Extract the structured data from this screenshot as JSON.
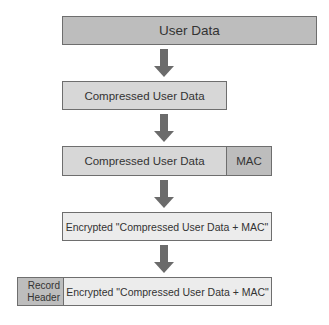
{
  "diagram": {
    "stages": [
      {
        "id": "user-data",
        "segments": [
          {
            "label": "User Data"
          }
        ]
      },
      {
        "id": "compressed",
        "segments": [
          {
            "label": "Compressed User Data"
          }
        ]
      },
      {
        "id": "compressed-mac",
        "segments": [
          {
            "label": "Compressed User Data"
          },
          {
            "label": "MAC"
          }
        ]
      },
      {
        "id": "encrypted",
        "segments": [
          {
            "label": "Encrypted \"Compressed User Data + MAC\""
          }
        ]
      },
      {
        "id": "record",
        "segments": [
          {
            "label": "Record Header"
          },
          {
            "label": "Encrypted \"Compressed User Data + MAC\""
          }
        ]
      }
    ],
    "record_header_lines": [
      "Record",
      "Header"
    ],
    "arrows": [
      {
        "from": "user-data",
        "to": "compressed",
        "icon": "down-arrow-icon"
      },
      {
        "from": "compressed",
        "to": "compressed-mac",
        "icon": "down-arrow-icon"
      },
      {
        "from": "compressed-mac",
        "to": "encrypted",
        "icon": "down-arrow-icon"
      },
      {
        "from": "encrypted",
        "to": "record",
        "icon": "down-arrow-icon"
      }
    ],
    "colors": {
      "dark_fill": "#bdbdbd",
      "mid_fill": "#d7d7d7",
      "light_fill": "#ececec",
      "border": "#6e6e6e",
      "arrow": "#6b6b6b",
      "text": "#333333"
    }
  }
}
